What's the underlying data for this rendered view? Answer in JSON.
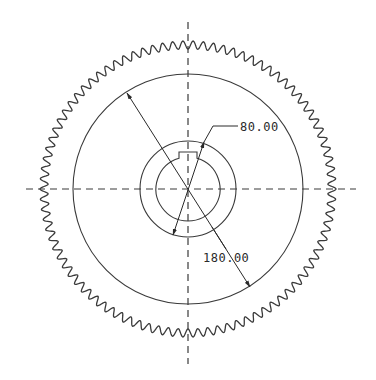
{
  "drawing": {
    "type": "gear-front-view",
    "line_color": "#3a3a3a",
    "background": "#ffffff",
    "center": [
      188,
      189
    ],
    "gear": {
      "tooth_count": 90,
      "tip_radius": 148,
      "root_radius": 140
    },
    "circles": {
      "pitch_like_circle_radius": 115,
      "hub_circle_radius": 48,
      "bore_radius": 32
    },
    "keyway": {
      "width": 18,
      "top_y": 152
    },
    "dimensions": [
      {
        "label": "80.00",
        "feature": "hub-diameter"
      },
      {
        "label": "180.00",
        "feature": "inner-circle-diameter"
      }
    ]
  }
}
